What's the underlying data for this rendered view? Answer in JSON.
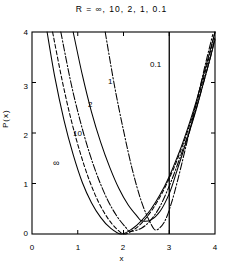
{
  "chart_data": {
    "type": "line",
    "title": "R = ∞, 10, 2, 1, 0.1",
    "xlabel": "x",
    "ylabel": "P(x)",
    "xlim": [
      0,
      4
    ],
    "ylim": [
      0,
      4
    ],
    "xticks": [
      "0",
      "1",
      "2",
      "3",
      "4"
    ],
    "yticks": [
      "0",
      "1",
      "2",
      "3",
      "4"
    ],
    "grid": false,
    "legend_position": "inline-curve-labels",
    "annotations": [
      {
        "text": "0.1",
        "x": 3.0,
        "y": 3.55
      },
      {
        "text": "1",
        "x": 2.06,
        "y": 3.08
      },
      {
        "text": "2",
        "x": 1.62,
        "y": 2.62
      },
      {
        "text": "10",
        "x": 1.3,
        "y": 2.02
      },
      {
        "text": "∞",
        "x": 0.92,
        "y": 1.38
      }
    ],
    "vertical_line_x": 3.0,
    "series": [
      {
        "name": "∞",
        "label": "∞",
        "style": "solid",
        "min_x": 1.95,
        "min_y": 0.0,
        "x": [
          0.33,
          0.5,
          0.7,
          0.9,
          1.1,
          1.3,
          1.5,
          1.7,
          1.95,
          2.2,
          2.4,
          2.6,
          2.8,
          3.0,
          3.2,
          3.3,
          3.45,
          3.6,
          3.8,
          4.0
        ],
        "y": [
          4.0,
          3.1,
          2.25,
          1.57,
          1.02,
          0.62,
          0.33,
          0.13,
          0.0,
          0.11,
          0.27,
          0.49,
          0.78,
          1.14,
          1.58,
          1.82,
          2.22,
          2.66,
          3.32,
          4.0
        ]
      },
      {
        "name": "10",
        "label": "10",
        "style": "dashed",
        "min_x": 2.0,
        "min_y": 0.0,
        "x": [
          0.45,
          0.65,
          0.85,
          1.05,
          1.25,
          1.45,
          1.65,
          1.85,
          2.02,
          2.25,
          2.45,
          2.65,
          2.85,
          3.05,
          3.2,
          3.35,
          3.5,
          3.65,
          3.85,
          4.0
        ],
        "y": [
          4.0,
          3.08,
          2.28,
          1.62,
          1.07,
          0.64,
          0.32,
          0.1,
          0.0,
          0.1,
          0.27,
          0.51,
          0.82,
          1.2,
          1.53,
          1.9,
          2.31,
          2.76,
          3.43,
          4.0
        ]
      },
      {
        "name": "2",
        "label": "2",
        "style": "dashdot",
        "min_x": 2.15,
        "min_y": 0.05,
        "x": [
          0.63,
          0.85,
          1.05,
          1.25,
          1.45,
          1.65,
          1.85,
          2.05,
          2.15,
          2.4,
          2.6,
          2.8,
          3.0,
          3.15,
          3.3,
          3.45,
          3.6,
          3.75,
          3.9,
          4.0
        ],
        "y": [
          4.0,
          3.0,
          2.25,
          1.62,
          1.1,
          0.68,
          0.36,
          0.13,
          0.05,
          0.12,
          0.28,
          0.55,
          0.95,
          1.3,
          1.68,
          2.08,
          2.52,
          3.0,
          3.5,
          3.9
        ]
      },
      {
        "name": "1",
        "label": "1",
        "style": "solid",
        "min_x": 2.4,
        "min_y": 0.26,
        "x": [
          0.9,
          1.1,
          1.3,
          1.5,
          1.7,
          1.9,
          2.1,
          2.3,
          2.4,
          2.6,
          2.8,
          3.0,
          3.15,
          3.3,
          3.45,
          3.6,
          3.75,
          3.9,
          4.0
        ],
        "y": [
          4.0,
          3.15,
          2.42,
          1.82,
          1.32,
          0.9,
          0.58,
          0.35,
          0.26,
          0.28,
          0.45,
          0.8,
          1.2,
          1.62,
          2.05,
          2.5,
          3.0,
          3.5,
          3.85
        ]
      },
      {
        "name": "0.1",
        "label": "0.1",
        "style": "dashdot",
        "min_x": 2.72,
        "min_y": 0.08,
        "x": [
          1.6,
          1.8,
          2.0,
          2.2,
          2.4,
          2.6,
          2.72,
          2.9,
          3.05,
          3.2,
          3.35,
          3.5,
          3.65,
          3.8,
          3.95
        ],
        "y": [
          4.0,
          2.95,
          2.05,
          1.25,
          0.62,
          0.2,
          0.08,
          0.25,
          0.62,
          1.12,
          1.68,
          2.25,
          2.82,
          3.4,
          3.95
        ]
      }
    ]
  }
}
